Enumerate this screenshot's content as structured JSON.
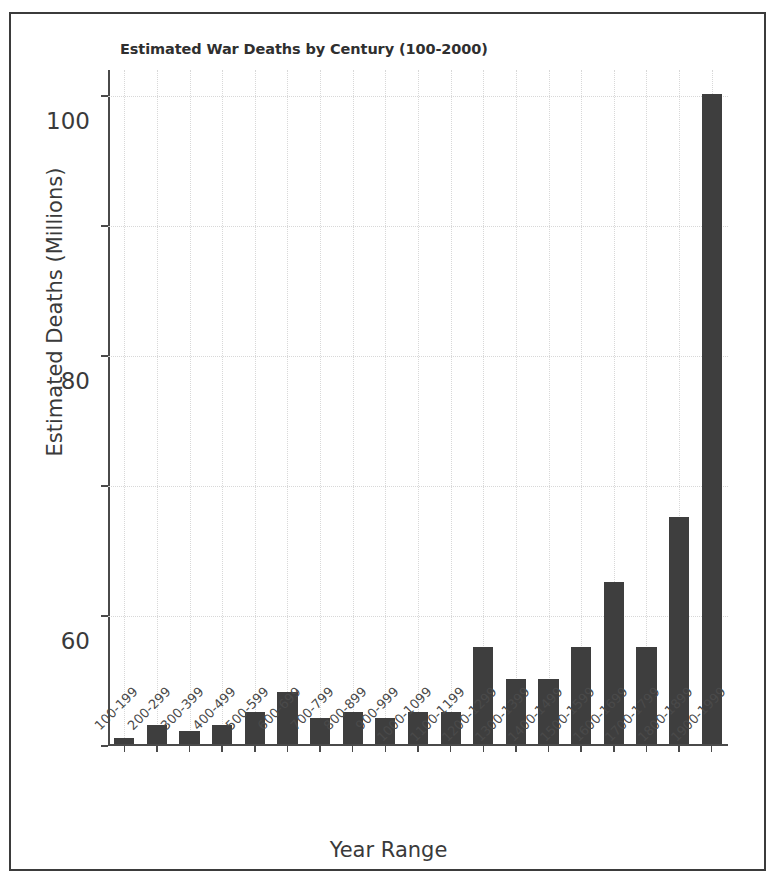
{
  "chart_data": {
    "type": "bar",
    "title": "Estimated War Deaths by Century (100-2000)",
    "xlabel": "Year Range",
    "ylabel": "Estimated Deaths (Millions)",
    "ylim": [
      0,
      104
    ],
    "yticks": [
      0,
      20,
      40,
      60,
      80,
      100
    ],
    "ytick_labels": [
      "0",
      "20",
      "40",
      "60",
      "80",
      "100"
    ],
    "grid": true,
    "grid_style": "dotted",
    "legend": "none",
    "bar_color": "#3e3e3e",
    "categories": [
      "100-199",
      "200-299",
      "300-399",
      "400-499",
      "500-599",
      "600-699",
      "700-799",
      "800-899",
      "900-999",
      "1000-1099",
      "1100-1199",
      "1200-1299",
      "1300-1399",
      "1400-1499",
      "1500-1599",
      "1600-1699",
      "1700-1799",
      "1800-1899",
      "1900-1999"
    ],
    "values": [
      1,
      3,
      2,
      3,
      5,
      8,
      4,
      5,
      4,
      5,
      5,
      15,
      10,
      10,
      15,
      25,
      15,
      35,
      100
    ]
  }
}
